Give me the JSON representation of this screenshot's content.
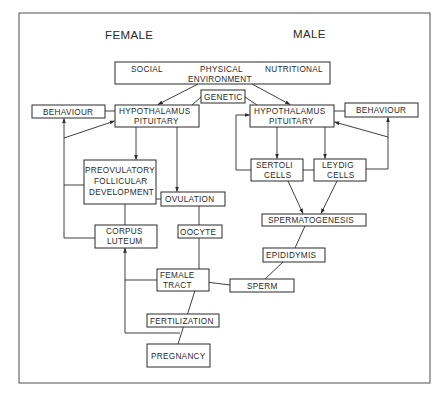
{
  "headings": {
    "female": "FEMALE",
    "male": "MALE"
  },
  "environment": {
    "social": "SOCIAL",
    "physical": "PHYSICAL",
    "nutritional": "NUTRITIONAL",
    "environment": "ENVIRONMENT"
  },
  "genetic": "GENETIC",
  "female": {
    "behaviour": "BEHAVIOUR",
    "hypothalamus_line1": "HYPOTHALAMUS",
    "hypothalamus_line2": "PITUITARY",
    "preovulatory_line1": "PREOVULATORY",
    "preovulatory_line2": "FOLLICULAR",
    "preovulatory_line3": "DEVELOPMENT",
    "ovulation": "OVULATION",
    "corpus_line1": "CORPUS",
    "corpus_line2": "LUTEUM",
    "oocyte": "OOCYTE",
    "tract_line1": "FEMALE",
    "tract_line2": "TRACT",
    "fertilization": "FERTILIZATION",
    "pregnancy": "PREGNANCY"
  },
  "male": {
    "behaviour": "BEHAVIOUR",
    "hypothalamus_line1": "HYPOTHALAMUS",
    "hypothalamus_line2": "PITUITARY",
    "sertoli_line1": "SERTOLI",
    "sertoli_line2": "CELLS",
    "leydig_line1": "LEYDIG",
    "leydig_line2": "CELLS",
    "spermatogenesis": "SPERMATOGENESIS",
    "epididymis": "EPIDIDYMIS",
    "sperm": "SPERM"
  }
}
